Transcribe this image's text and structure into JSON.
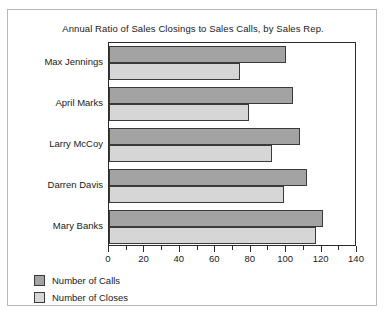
{
  "chart_data": {
    "type": "bar",
    "orientation": "horizontal",
    "title": "Annual Ratio of Sales Closings to Sales Calls, by Sales Rep.",
    "xlabel": "",
    "ylabel": "",
    "xlim": [
      0,
      140
    ],
    "xticks": [
      0,
      20,
      40,
      60,
      80,
      100,
      120,
      140
    ],
    "xtick_labels": [
      "0",
      "20",
      "40",
      "60",
      "80",
      "100",
      "120",
      "140"
    ],
    "minor_tick_interval": 10,
    "grid": false,
    "legend_position": "below-left",
    "categories": [
      "Max Jennings",
      "April Marks",
      "Larry McCoy",
      "Darren Davis",
      "Mary Banks"
    ],
    "series": [
      {
        "name": "Number of Calls",
        "color": "#a3a3a3",
        "values": [
          100,
          104,
          108,
          112,
          121
        ]
      },
      {
        "name": "Number of Closes",
        "color": "#d6d6d6",
        "values": [
          74,
          79,
          92,
          99,
          117
        ]
      }
    ]
  },
  "legend": {
    "items": [
      {
        "label": "Number of Calls"
      },
      {
        "label": "Number of Closes"
      }
    ]
  },
  "colors": {
    "calls": "#a3a3a3",
    "closes": "#d6d6d6",
    "axis": "#2b2b2b",
    "card_border": "#b9b9b9"
  }
}
